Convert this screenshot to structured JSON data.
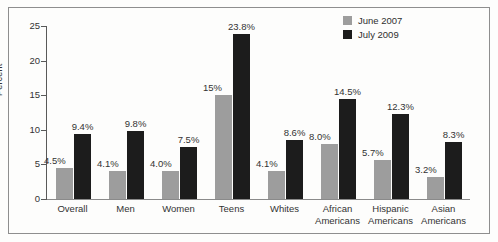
{
  "chart_data": {
    "type": "bar",
    "title": "",
    "xlabel": "",
    "ylabel": "Percent",
    "ylim": [
      0,
      25
    ],
    "yticks": [
      0,
      5,
      10,
      15,
      20,
      25
    ],
    "grid": false,
    "legend_position": "top-right",
    "categories": [
      "Overall",
      "Men",
      "Women",
      "Teens",
      "Whites",
      "African\nAmericans",
      "Hispanic\nAmericans",
      "Asian\nAmericans"
    ],
    "category_lines": [
      [
        "Overall"
      ],
      [
        "Men"
      ],
      [
        "Women"
      ],
      [
        "Teens"
      ],
      [
        "Whites"
      ],
      [
        "African",
        "Americans"
      ],
      [
        "Hispanic",
        "Americans"
      ],
      [
        "Asian",
        "Americans"
      ]
    ],
    "series": [
      {
        "name": "June 2007",
        "color": "#9d9d9d",
        "values": [
          4.5,
          4.1,
          4.0,
          15.0,
          4.1,
          8.0,
          5.7,
          3.2
        ],
        "labels": [
          "4.5%",
          "4.1%",
          "4.0%",
          "15%",
          "4.1%",
          "8.0%",
          "5.7%",
          "3.2%"
        ]
      },
      {
        "name": "July 2009",
        "color": "#1c1c1c",
        "values": [
          9.4,
          9.8,
          7.5,
          23.8,
          8.6,
          14.5,
          12.3,
          8.3
        ],
        "labels": [
          "9.4%",
          "9.8%",
          "7.5%",
          "23.8%",
          "8.6%",
          "14.5%",
          "12.3%",
          "8.3%"
        ]
      }
    ]
  },
  "legend": {
    "items": [
      {
        "label": "June 2007",
        "swatch": "s0"
      },
      {
        "label": "July 2009",
        "swatch": "s1"
      }
    ]
  },
  "axis": {
    "y_title": "Percent",
    "y_tick_labels": [
      "0",
      "5",
      "10",
      "15",
      "20",
      "25"
    ]
  }
}
